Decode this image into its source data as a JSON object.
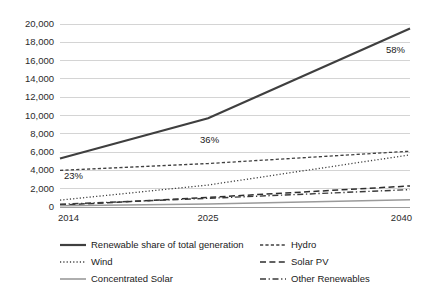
{
  "chart_data": {
    "type": "line",
    "title": "",
    "xlabel": "",
    "ylabel": "",
    "x": [
      2014,
      2025,
      2040
    ],
    "xtick_labels": [
      "2014",
      "2025",
      "2040"
    ],
    "xlim": [
      2014,
      2040
    ],
    "ylim": [
      0,
      20000
    ],
    "ytick_labels": [
      "0",
      "2,000",
      "4,000",
      "6,000",
      "8,000",
      "10,000",
      "12,000",
      "14,000",
      "16,000",
      "18,000",
      "20,000"
    ],
    "ytick_values": [
      0,
      2000,
      4000,
      6000,
      8000,
      10000,
      12000,
      14000,
      16000,
      18000,
      20000
    ],
    "grid": "horizontal",
    "legend_position": "bottom",
    "series": [
      {
        "name": "Renewable share of total generation",
        "style": "solid",
        "color": "#3f3f3f",
        "width": 2.2,
        "values": [
          5300,
          9700,
          19500
        ]
      },
      {
        "name": "Hydro",
        "style": "dashed-short",
        "color": "#404040",
        "width": 1.3,
        "values": [
          4000,
          4750,
          6100
        ]
      },
      {
        "name": "Wind",
        "style": "dotted",
        "color": "#404040",
        "width": 1.3,
        "values": [
          750,
          2400,
          5700
        ]
      },
      {
        "name": "Solar PV",
        "style": "dashed-long",
        "color": "#2e2e2e",
        "width": 1.5,
        "values": [
          200,
          1050,
          2300
        ]
      },
      {
        "name": "Concentrated Solar",
        "style": "solid",
        "color": "#9a9a9a",
        "width": 1.6,
        "values": [
          130,
          330,
          800
        ]
      },
      {
        "name": "Other Renewables",
        "style": "dash-dot",
        "color": "#3a3a3a",
        "width": 1.4,
        "values": [
          300,
          950,
          1900
        ]
      }
    ],
    "annotations": [
      {
        "text": "23%",
        "x": 2014,
        "y": 4200,
        "series": "Renewable share of total generation"
      },
      {
        "text": "36%",
        "x": 2025,
        "y": 8500,
        "series": "Renewable share of total generation"
      },
      {
        "text": "58%",
        "x": 2040,
        "y": 18100,
        "series": "Renewable share of total generation"
      }
    ]
  },
  "legend": {
    "items": [
      {
        "label": "Renewable share of total generation",
        "swatch": "solid-thick-dark"
      },
      {
        "label": "Hydro",
        "swatch": "dashed-short"
      },
      {
        "label": "Wind",
        "swatch": "dotted"
      },
      {
        "label": "Solar PV",
        "swatch": "dashed-long"
      },
      {
        "label": "Concentrated Solar",
        "swatch": "solid-gray"
      },
      {
        "label": "Other Renewables",
        "swatch": "dash-dot"
      }
    ]
  }
}
